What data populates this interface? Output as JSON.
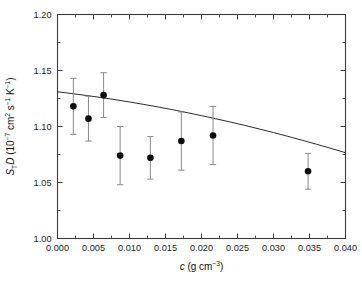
{
  "chart_data": {
    "type": "scatter",
    "title": "",
    "xlabel": "c  (g cm-3)",
    "xlabel_symbol": "c",
    "xlabel_unit_pre": "(g cm",
    "xlabel_unit_sup": "−3",
    "xlabel_unit_post": ")",
    "ylabel": "ST D (10-7 cm2 s-1 K-1)",
    "ylabel_sym1": "S",
    "ylabel_sub1": "T",
    "ylabel_sym2": "D",
    "ylabel_unit_open": "(10",
    "ylabel_unit_sup1": "−7",
    "ylabel_unit_mid1": " cm",
    "ylabel_unit_sup2": "2",
    "ylabel_unit_mid2": " s",
    "ylabel_unit_sup3": "−1",
    "ylabel_unit_mid3": " K",
    "ylabel_unit_sup4": "−1",
    "ylabel_unit_close": ")",
    "xlim": [
      0.0,
      0.04
    ],
    "ylim": [
      1.0,
      1.2
    ],
    "xticks": [
      0.0,
      0.005,
      0.01,
      0.015,
      0.02,
      0.025,
      0.03,
      0.035,
      0.04
    ],
    "xticklabels": [
      "0.000",
      "0.005",
      "0.010",
      "0.015",
      "0.020",
      "0.025",
      "0.030",
      "0.035",
      "0.040"
    ],
    "yticks": [
      1.0,
      1.05,
      1.1,
      1.15,
      1.2
    ],
    "yticklabels": [
      "1.00",
      "1.05",
      "1.10",
      "1.15",
      "1.20"
    ],
    "yminor": [
      1.025,
      1.075,
      1.125,
      1.175
    ],
    "xminor": [
      0.0025,
      0.0075,
      0.0125,
      0.0175,
      0.0225,
      0.0275,
      0.0325,
      0.0375
    ],
    "grid": false,
    "legend": null,
    "marker_color": "#0d0d0d",
    "errorbar_color": "#8a8a8a",
    "curve_color": "#2b2b2b",
    "axis_color": "#3a3a3a",
    "background": "#ffffff",
    "tick_direction": "in",
    "points": [
      {
        "x": 0.0022,
        "y": 1.118,
        "yerr": 0.025
      },
      {
        "x": 0.0043,
        "y": 1.107,
        "yerr": 0.02
      },
      {
        "x": 0.0064,
        "y": 1.128,
        "yerr": 0.02
      },
      {
        "x": 0.0087,
        "y": 1.074,
        "yerr": 0.026
      },
      {
        "x": 0.0129,
        "y": 1.072,
        "yerr": 0.019
      },
      {
        "x": 0.0172,
        "y": 1.087,
        "yerr": 0.026
      },
      {
        "x": 0.0216,
        "y": 1.092,
        "yerr": 0.026
      },
      {
        "x": 0.0348,
        "y": 1.06,
        "yerr": 0.016
      }
    ],
    "curve": {
      "name": "model fit",
      "x": [
        0.0,
        0.002,
        0.004,
        0.006,
        0.008,
        0.01,
        0.012,
        0.014,
        0.016,
        0.018,
        0.02,
        0.022,
        0.024,
        0.026,
        0.028,
        0.03,
        0.032,
        0.034,
        0.036,
        0.038,
        0.04
      ],
      "y": [
        1.131,
        1.1294,
        1.1277,
        1.1259,
        1.124,
        1.1219,
        1.1197,
        1.1174,
        1.115,
        1.1124,
        1.1097,
        1.1069,
        1.104,
        1.101,
        1.0978,
        1.0946,
        1.0912,
        1.0877,
        1.0841,
        1.0804,
        1.0766
      ]
    }
  }
}
